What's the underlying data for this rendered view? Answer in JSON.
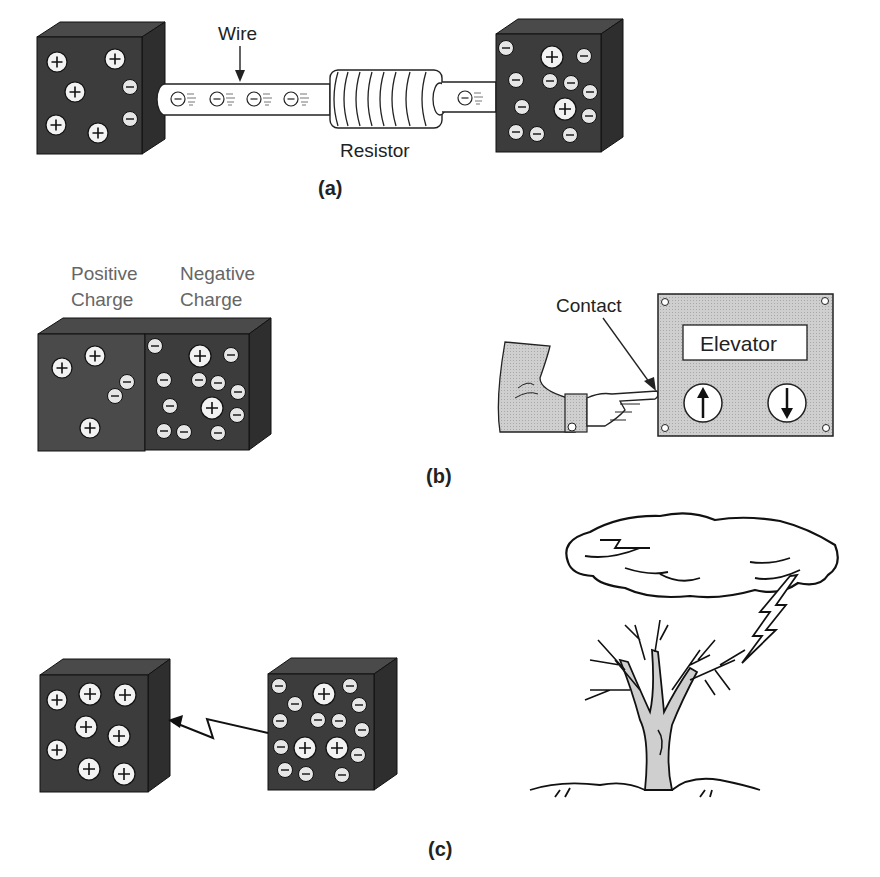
{
  "panel_a": {
    "caption": "(a)",
    "wire_label": "Wire",
    "resistor_label": "Resistor",
    "left_box": {
      "charges": [
        "+",
        "+",
        "+",
        "-",
        "+",
        "+",
        "-"
      ]
    },
    "right_box": {
      "charges": [
        "-",
        "+",
        "-",
        "-",
        "-",
        "-",
        "-",
        "-",
        "+",
        "-",
        "-",
        "-",
        "-"
      ]
    },
    "flowing_electrons": 5
  },
  "panel_b": {
    "caption": "(b)",
    "positive_label_line1": "Positive",
    "positive_label_line2": "Charge",
    "negative_label_line1": "Negative",
    "negative_label_line2": "Charge",
    "contact_label": "Contact",
    "elevator_label": "Elevator",
    "up_button": "up-arrow",
    "down_button": "down-arrow"
  },
  "panel_c": {
    "caption": "(c)",
    "left_box": {
      "charges": [
        "+",
        "+",
        "+",
        "+",
        "+",
        "+",
        "+",
        "+"
      ]
    },
    "right_box": {
      "charges": [
        "-",
        "+",
        "-",
        "-",
        "-",
        "-",
        "-",
        "-",
        "-",
        "+",
        "+",
        "-",
        "-",
        "-",
        "-"
      ]
    },
    "scene": "lightning-striking-tree"
  },
  "colors": {
    "box_front": "#3c3c3c",
    "box_top": "#4a4a4a",
    "box_side": "#2e2e2e",
    "panel_fill": "#c8c8c8",
    "ink": "#222222"
  }
}
